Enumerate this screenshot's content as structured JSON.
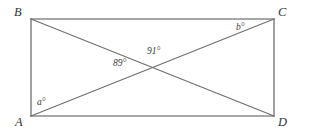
{
  "figure": {
    "type": "geometry-diagram",
    "shape": "rectangle-with-diagonals",
    "background_color": "#ffffff",
    "line_color": "#7f7f7f",
    "label_color": "#3a3a3a",
    "canvas": {
      "width": 311,
      "height": 134
    },
    "rectangle": {
      "left": 31,
      "right": 274,
      "top": 19,
      "bottom": 116
    },
    "intersection": {
      "x": 152,
      "y": 67
    },
    "vertices": [
      {
        "id": "B",
        "label": "B",
        "corner": "top-left",
        "point_x": 31,
        "point_y": 19,
        "label_x": 14,
        "label_y": 6
      },
      {
        "id": "C",
        "label": "C",
        "corner": "top-right",
        "point_x": 274,
        "point_y": 19,
        "label_x": 278,
        "label_y": 6
      },
      {
        "id": "A",
        "label": "A",
        "corner": "bottom-left",
        "point_x": 31,
        "point_y": 116,
        "label_x": 15,
        "label_y": 116
      },
      {
        "id": "D",
        "label": "D",
        "corner": "bottom-right",
        "point_x": 274,
        "point_y": 116,
        "label_x": 278,
        "label_y": 116
      }
    ],
    "diagonals": [
      {
        "id": "BD",
        "from": "B",
        "to": "D"
      },
      {
        "id": "AC",
        "from": "A",
        "to": "C"
      }
    ],
    "angles": [
      {
        "id": "a",
        "label": "a°",
        "at_vertex": "A",
        "known": false,
        "label_x": 37,
        "label_y": 98
      },
      {
        "id": "b",
        "label": "b°",
        "at_vertex": "C",
        "known": false,
        "label_x": 236,
        "label_y": 23
      },
      {
        "id": "89",
        "label": "89°",
        "at_vertex": "intersection",
        "known": true,
        "value": 89,
        "label_x": 113,
        "label_y": 59
      },
      {
        "id": "91",
        "label": "91°",
        "at_vertex": "intersection",
        "known": true,
        "value": 91,
        "label_x": 147,
        "label_y": 47
      }
    ]
  }
}
